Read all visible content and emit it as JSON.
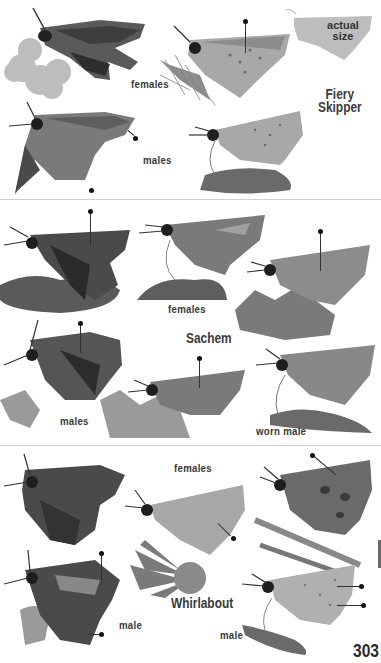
{
  "page": {
    "page_number": "303",
    "background": "#ffffff",
    "text_color": "#3a3a3a"
  },
  "sections": [
    {
      "species": "Fiery Skipper",
      "species_line1": "Fiery",
      "species_line2": "Skipper",
      "actual_size_label_line1": "actual",
      "actual_size_label_line2": "size",
      "labels": {
        "females": "females",
        "males": "males"
      },
      "photos": [
        {
          "subject": "female, wings spread, on flower cluster"
        },
        {
          "subject": "female, side view, on thistle"
        },
        {
          "subject": "male, wings spread"
        },
        {
          "subject": "male, side view, on flower"
        }
      ]
    },
    {
      "species": "Sachem",
      "labels": {
        "females": "females",
        "males": "males",
        "worn_male": "worn male"
      },
      "photos": [
        {
          "subject": "female, on moss"
        },
        {
          "subject": "female, side view, on moss"
        },
        {
          "subject": "female, side view, on flowers"
        },
        {
          "subject": "male, wings spread, on flower"
        },
        {
          "subject": "male, side view, on flowers"
        },
        {
          "subject": "worn male, side view, on flower"
        }
      ]
    },
    {
      "species": "Whirlabout",
      "labels": {
        "females": "females",
        "male_left": "male",
        "male_right": "male"
      },
      "photos": [
        {
          "subject": "female, wings spread"
        },
        {
          "subject": "female, side view, on daisy"
        },
        {
          "subject": "female, side view, on grass stem"
        },
        {
          "subject": "male, wings spread"
        },
        {
          "subject": "male, side view, on leaf"
        }
      ]
    }
  ]
}
